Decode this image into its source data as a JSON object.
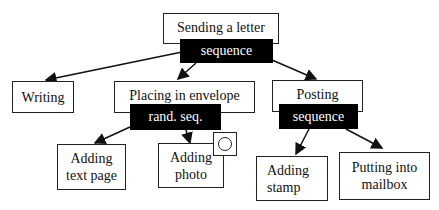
{
  "diagram": {
    "root": {
      "label": "Sending a letter",
      "operator": "sequence"
    },
    "children": [
      {
        "label": "Writing"
      },
      {
        "label": "Placing in envelope",
        "operator": "rand. seq.",
        "children": [
          {
            "label": "Adding text page"
          },
          {
            "label": "Adding photo",
            "marker": "optional-circle"
          }
        ]
      },
      {
        "label": "Posting",
        "operator": "sequence",
        "children": [
          {
            "label": "Adding stamp"
          },
          {
            "label": "Putting into mailbox"
          }
        ]
      }
    ]
  },
  "labels": {
    "root": "Sending a letter",
    "root_op": "sequence",
    "writing": "Writing",
    "placing": "Placing in envelope",
    "placing_op": "rand. seq.",
    "text_page_1": "Adding",
    "text_page_2": "text page",
    "photo_1": "Adding",
    "photo_2": "photo",
    "posting": "Posting",
    "posting_op": "sequence",
    "stamp_1": "Adding",
    "stamp_2": "stamp",
    "mailbox_1": "Putting into",
    "mailbox_2": "mailbox"
  },
  "colors": {
    "operator_bg": "#000000",
    "operator_text": "#ffffff",
    "border": "#222222"
  }
}
